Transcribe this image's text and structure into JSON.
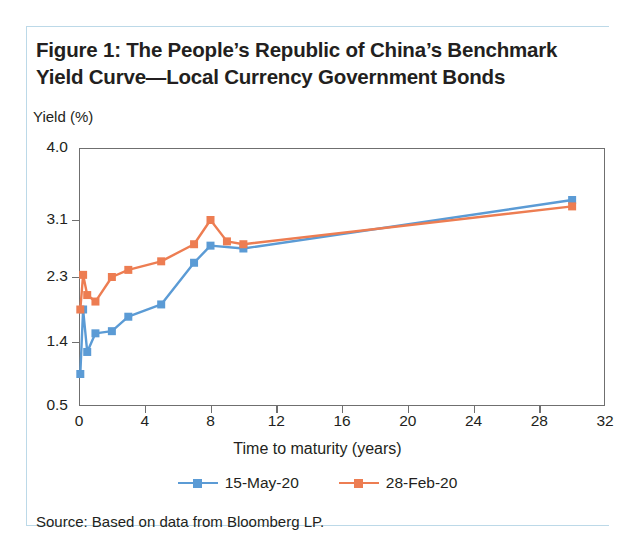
{
  "figure": {
    "title": "Figure 1: The People’s Republic of China’s Benchmark Yield Curve—Local Currency Government Bonds",
    "source": "Source: Based on data from Bloomberg LP."
  },
  "colors": {
    "series_blue": "#5B9BD5",
    "series_orange": "#ED7D52",
    "axis": "#6f6f6f",
    "text": "#231f20",
    "card_border": "#bcd9e8"
  },
  "chart_data": {
    "type": "line",
    "title": "Figure 1: The People’s Republic of China’s Benchmark Yield Curve—Local Currency Government Bonds",
    "xlabel": "Time to maturity (years)",
    "ylabel": "Yield (%)",
    "xlim": [
      0,
      32
    ],
    "ylim": [
      0.5,
      4.0
    ],
    "xticks": [
      0,
      4,
      8,
      12,
      16,
      20,
      24,
      28,
      32
    ],
    "xtick_labels": [
      "0",
      "4",
      "8",
      "12",
      "16",
      "20",
      "24",
      "28",
      "32"
    ],
    "yticks": [
      0.5,
      1.4,
      2.3,
      3.1,
      4.0
    ],
    "ytick_labels": [
      "0.5",
      "1.4",
      "2.3",
      "3.1",
      "4.0"
    ],
    "grid": false,
    "legend_position": "bottom",
    "markers": "square",
    "series": [
      {
        "name": "15-May-20",
        "color": "#5B9BD5",
        "x": [
          0.08,
          0.25,
          0.5,
          1,
          2,
          3,
          5,
          7,
          8,
          10,
          30
        ],
        "y": [
          0.95,
          1.85,
          1.26,
          1.52,
          1.55,
          1.75,
          1.92,
          2.5,
          2.74,
          2.7,
          3.35
        ]
      },
      {
        "name": "28-Feb-20",
        "color": "#ED7D52",
        "x": [
          0.08,
          0.25,
          0.5,
          1,
          2,
          3,
          5,
          7,
          8,
          9,
          10,
          30
        ],
        "y": [
          1.85,
          2.33,
          2.05,
          1.96,
          2.3,
          2.4,
          2.52,
          2.76,
          3.1,
          2.8,
          2.76,
          3.27
        ]
      }
    ]
  },
  "legend": {
    "entries": [
      {
        "label": "15-May-20"
      },
      {
        "label": "28-Feb-20"
      }
    ]
  }
}
